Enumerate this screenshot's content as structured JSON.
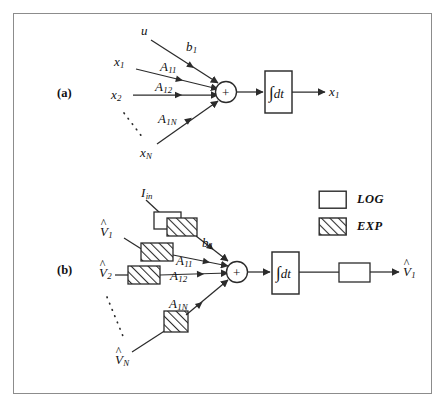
{
  "figure": {
    "background": "#ffffff",
    "border_color": "#8c8c8c",
    "stroke_color": "#2b2b2b",
    "hatch_color": "#2b2b2b"
  },
  "panels": [
    {
      "id": "a",
      "label": "(a)"
    },
    {
      "id": "b",
      "label": "(b)"
    }
  ],
  "panel_a": {
    "inputs": [
      {
        "name": "u",
        "symbol": "u",
        "sub": "",
        "gain_label": "b",
        "gain_sub": "1"
      },
      {
        "name": "x1",
        "symbol": "x",
        "sub": "1",
        "gain_label": "A",
        "gain_sub": "11"
      },
      {
        "name": "x2",
        "symbol": "x",
        "sub": "2",
        "gain_label": "A",
        "gain_sub": "12"
      },
      {
        "name": "xN",
        "symbol": "x",
        "sub": "N",
        "gain_label": "A",
        "gain_sub": "1N"
      }
    ],
    "summer": {
      "operator": "+"
    },
    "integrator": {
      "label": "∫dt",
      "integral_sign": "∫",
      "differential": "dt"
    },
    "output": {
      "symbol": "x",
      "sub": "1"
    },
    "ellipsis": "dotted"
  },
  "panel_b": {
    "current_input": {
      "symbol": "I",
      "sub": "in"
    },
    "inputs": [
      {
        "name": "V1",
        "symbol": "V",
        "sub": "1",
        "hat": true,
        "gain_label": "A",
        "gain_sub": "11",
        "block": "EXP"
      },
      {
        "name": "V2",
        "symbol": "V",
        "sub": "2",
        "hat": true,
        "gain_label": "A",
        "gain_sub": "12",
        "block": "EXP"
      },
      {
        "name": "VN",
        "symbol": "V",
        "sub": "N",
        "hat": true,
        "gain_label": "A",
        "gain_sub": "1N",
        "block": "EXP"
      }
    ],
    "bias": {
      "gain_label": "b",
      "gain_sub": "1",
      "blocks": [
        "LOG",
        "EXP"
      ]
    },
    "summer": {
      "operator": "+"
    },
    "integrator": {
      "label": "∫dt",
      "integral_sign": "∫",
      "differential": "dt"
    },
    "output_block": "LOG",
    "output": {
      "symbol": "V",
      "sub": "1",
      "hat": true
    },
    "ellipsis": "dotted"
  },
  "legend": {
    "items": [
      {
        "key": "log",
        "label": "LOG",
        "fill": "none"
      },
      {
        "key": "exp",
        "label": "EXP",
        "fill": "hatched"
      }
    ]
  }
}
